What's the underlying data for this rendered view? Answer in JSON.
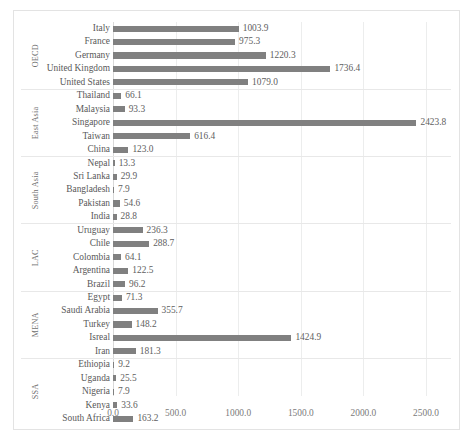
{
  "chart_data": {
    "type": "bar",
    "orientation": "horizontal",
    "title": "",
    "xlabel": "",
    "ylabel": "",
    "xlim": [
      0,
      2500
    ],
    "grid": true,
    "legend": "none",
    "tick_labels": [
      "0.0",
      "500.0",
      "1000.0",
      "1500.0",
      "2000.0",
      "2500.0"
    ],
    "ticks": [
      0,
      500,
      1000,
      1500,
      2000,
      2500
    ],
    "bar_color": "#808080",
    "gridline_color": "#eceded",
    "groups": [
      {
        "label": "OECD",
        "categories": [
          "Italy",
          "France",
          "Germany",
          "United Kingdom",
          "United States"
        ],
        "values": [
          1003.9,
          975.3,
          1220.3,
          1736.4,
          1079.0
        ],
        "value_labels": [
          "1003.9",
          "975.3",
          "1220.3",
          "1736.4",
          "1079.0"
        ]
      },
      {
        "label": "East Asia",
        "categories": [
          "Thailand",
          "Malaysia",
          "Singapore",
          "Taiwan",
          "China"
        ],
        "values": [
          66.1,
          93.3,
          2423.8,
          616.4,
          123.0
        ],
        "value_labels": [
          "66.1",
          "93.3",
          "2423.8",
          "616.4",
          "123.0"
        ]
      },
      {
        "label": "South Asia",
        "categories": [
          "Nepal",
          "Sri Lanka",
          "Bangladesh",
          "Pakistan",
          "India"
        ],
        "values": [
          13.3,
          29.9,
          7.9,
          54.6,
          28.8
        ],
        "value_labels": [
          "13.3",
          "29.9",
          "7.9",
          "54.6",
          "28.8"
        ]
      },
      {
        "label": "LAC",
        "categories": [
          "Uruguay",
          "Chile",
          "Colombia",
          "Argentina",
          "Brazil"
        ],
        "values": [
          236.3,
          288.7,
          64.1,
          122.5,
          96.2
        ],
        "value_labels": [
          "236.3",
          "288.7",
          "64.1",
          "122.5",
          "96.2"
        ]
      },
      {
        "label": "MENA",
        "categories": [
          "Egypt",
          "Saudi Arabia",
          "Turkey",
          "Isreal",
          "Iran"
        ],
        "values": [
          71.3,
          355.7,
          148.2,
          1424.9,
          181.3
        ],
        "value_labels": [
          "71.3",
          "355.7",
          "148.2",
          "1424.9",
          "181.3"
        ]
      },
      {
        "label": "SSA",
        "categories": [
          "Ethiopia",
          "Uganda",
          "Nigeria",
          "Kenya",
          "South Africa"
        ],
        "values": [
          9.2,
          25.5,
          7.9,
          33.6,
          163.2
        ],
        "value_labels": [
          "9.2",
          "25.5",
          "7.9",
          "33.6",
          "163.2"
        ]
      }
    ]
  }
}
